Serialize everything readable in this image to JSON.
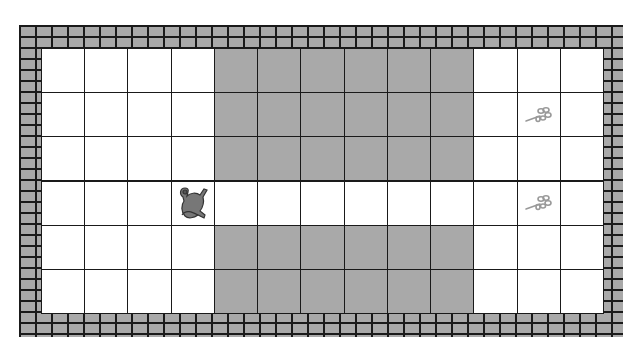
{
  "game": {
    "type": "gridworld",
    "columns": 13,
    "rows": 6,
    "cell_size_px": 43.2,
    "colors": {
      "floor": "#ffffff",
      "wall": "#a9a9a9",
      "mortar": "#1a1a1a",
      "item": "#999999",
      "agent": "#777777"
    },
    "layout": [
      "....WWWWWW...",
      "....WWWWWW.P.",
      "....WWWWWW...",
      "...A.......P.",
      "....WWWWWW...",
      "....WWWWWW..."
    ],
    "agent": {
      "row": 3,
      "col": 3,
      "icon": "creature-icon"
    },
    "items": [
      {
        "row": 1,
        "col": 11,
        "icon": "plant-sprig-icon"
      },
      {
        "row": 3,
        "col": 12,
        "icon": "plant-sprig-icon"
      }
    ]
  }
}
